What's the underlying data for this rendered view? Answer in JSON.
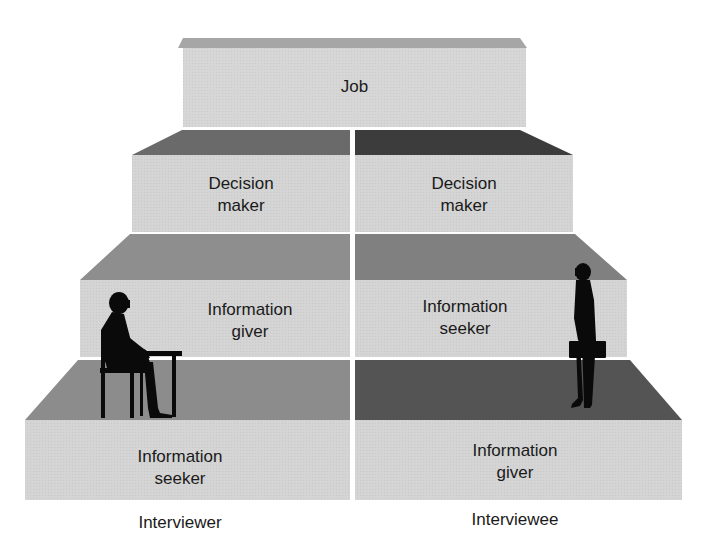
{
  "diagram": {
    "type": "stepped-pyramid",
    "colors": {
      "face": "#d4d4d4",
      "top_light": "#a8a8a8",
      "top_medium": "#8f8f8f",
      "top_dark": "#5a5a5a",
      "top_darker": "#3e3e3e",
      "divider": "#ffffff",
      "text": "#1a1a1a",
      "silhouette": "#0a0a0a"
    },
    "levels": [
      {
        "name": "job",
        "left": {
          "lines": [
            "Job"
          ]
        }
      },
      {
        "name": "decision",
        "left": {
          "lines": [
            "Decision",
            "maker"
          ]
        },
        "right": {
          "lines": [
            "Decision",
            "maker"
          ]
        }
      },
      {
        "name": "info-middle",
        "left": {
          "lines": [
            "Information",
            "giver"
          ]
        },
        "right": {
          "lines": [
            "Information",
            "seeker"
          ]
        }
      },
      {
        "name": "info-bottom",
        "left": {
          "lines": [
            "Information",
            "seeker"
          ]
        },
        "right": {
          "lines": [
            "Information",
            "giver"
          ]
        }
      }
    ],
    "captions": {
      "left": "Interviewer",
      "right": "Interviewee"
    },
    "figures": {
      "left": "seated-person-at-desk-icon",
      "right": "standing-person-with-briefcase-icon"
    }
  }
}
